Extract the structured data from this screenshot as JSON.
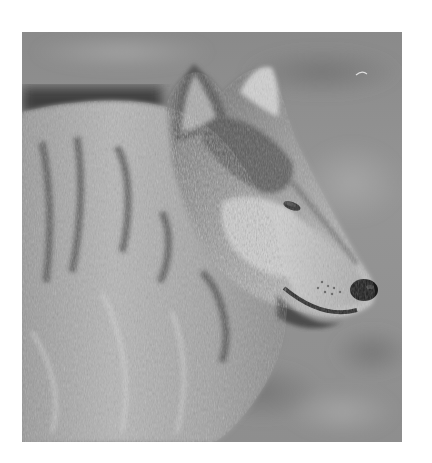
{
  "image": {
    "subject": "Gray wolf in profile facing right",
    "style": "grayscale photograph",
    "alt": "Black and white close-up photograph of a gray wolf's head and shoulders in profile, facing right, against a blurred grassy background"
  },
  "colors": {
    "page_background": "#ffffff",
    "background_blur": "#8c8c8c",
    "fur_light": "#c8c8c8",
    "fur_mid": "#8f8f8f",
    "fur_dark": "#3a3a3a",
    "nose": "#1a1a1a"
  }
}
